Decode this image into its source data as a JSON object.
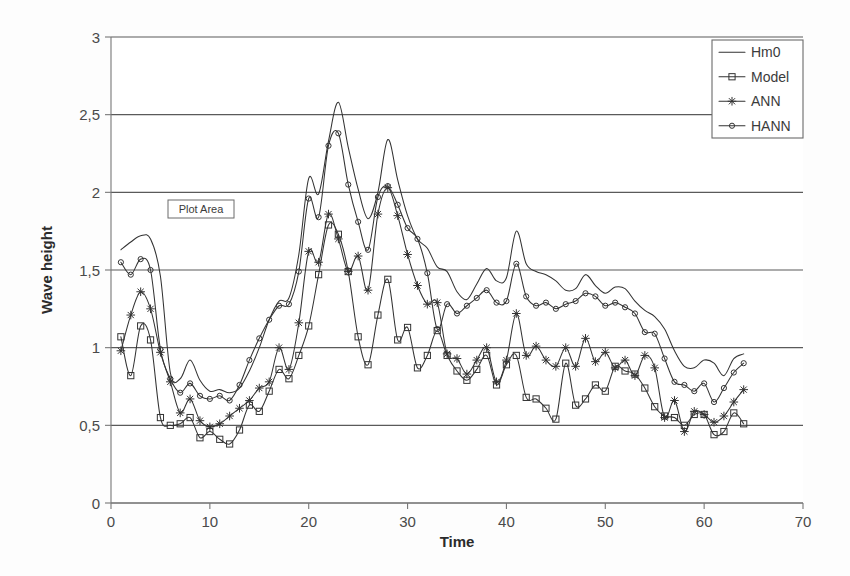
{
  "chart_data": {
    "type": "line",
    "title": "",
    "xlabel": "Time",
    "ylabel": "Wave height",
    "xlim": [
      0,
      70
    ],
    "ylim": [
      0,
      3
    ],
    "xticks": [
      "0",
      "10",
      "20",
      "30",
      "40",
      "50",
      "60",
      "70"
    ],
    "xtick_values": [
      0,
      10,
      20,
      30,
      40,
      50,
      60,
      70
    ],
    "yticks": [
      "0",
      "0,5",
      "1",
      "1,5",
      "2",
      "2,5",
      "3"
    ],
    "ytick_values": [
      0,
      0.5,
      1,
      1.5,
      2,
      2.5,
      3
    ],
    "decimal_separator": ",",
    "grid": "horizontal",
    "legend_position": "top-right",
    "x": [
      1,
      2,
      3,
      4,
      5,
      6,
      7,
      8,
      9,
      10,
      11,
      12,
      13,
      14,
      15,
      16,
      17,
      18,
      19,
      20,
      21,
      22,
      23,
      24,
      25,
      26,
      27,
      28,
      29,
      30,
      31,
      32,
      33,
      34,
      35,
      36,
      37,
      38,
      39,
      40,
      41,
      42,
      43,
      44,
      45,
      46,
      47,
      48,
      49,
      50,
      51,
      52,
      53,
      54,
      55,
      56,
      57,
      58,
      59,
      60,
      61,
      62,
      63,
      64
    ],
    "series": [
      {
        "name": "Hm0",
        "marker": "none",
        "values": [
          1.63,
          1.68,
          1.72,
          1.7,
          1.46,
          0.84,
          0.8,
          0.92,
          0.79,
          0.72,
          0.73,
          0.71,
          0.74,
          0.85,
          1.0,
          1.18,
          1.3,
          1.32,
          1.6,
          2.09,
          1.99,
          2.33,
          2.58,
          2.29,
          2.02,
          1.83,
          2.0,
          2.34,
          2.08,
          1.85,
          1.7,
          1.64,
          1.52,
          1.49,
          1.36,
          1.31,
          1.41,
          1.51,
          1.43,
          1.45,
          1.75,
          1.54,
          1.49,
          1.47,
          1.43,
          1.37,
          1.38,
          1.47,
          1.4,
          1.35,
          1.39,
          1.38,
          1.3,
          1.24,
          1.2,
          1.12,
          0.98,
          0.88,
          0.87,
          0.92,
          0.9,
          0.82,
          0.93,
          0.96
        ],
        "final_value_note": "ends x=64"
      },
      {
        "name": "Model",
        "marker": "square",
        "values": [
          1.07,
          0.82,
          1.14,
          1.05,
          0.55,
          0.5,
          0.51,
          0.55,
          0.42,
          0.46,
          0.41,
          0.38,
          0.47,
          0.63,
          0.59,
          0.72,
          0.86,
          0.8,
          0.95,
          1.14,
          1.47,
          1.79,
          1.73,
          1.49,
          1.07,
          0.89,
          1.21,
          1.44,
          1.05,
          1.13,
          0.87,
          0.95,
          1.11,
          0.95,
          0.85,
          0.79,
          0.86,
          0.95,
          0.76,
          0.89,
          0.95,
          0.68,
          0.67,
          0.61,
          0.54,
          0.9,
          0.63,
          0.67,
          0.76,
          0.72,
          0.88,
          0.85,
          0.83,
          0.74,
          0.62,
          0.56,
          0.55,
          0.5,
          0.57,
          0.57,
          0.44,
          0.46,
          0.58,
          0.51
        ]
      },
      {
        "name": "ANN",
        "marker": "asterisk",
        "values": [
          0.98,
          1.21,
          1.36,
          1.25,
          0.97,
          0.78,
          0.58,
          0.67,
          0.53,
          0.49,
          0.51,
          0.56,
          0.61,
          0.66,
          0.74,
          0.78,
          1.0,
          0.86,
          1.16,
          1.62,
          1.55,
          1.86,
          1.7,
          1.49,
          1.59,
          1.37,
          1.86,
          2.03,
          1.85,
          1.6,
          1.4,
          1.28,
          1.29,
          0.96,
          0.93,
          0.83,
          0.92,
          1.0,
          0.78,
          0.92,
          1.22,
          0.95,
          1.01,
          0.92,
          0.88,
          1.0,
          0.88,
          1.06,
          0.91,
          0.97,
          0.87,
          0.92,
          0.82,
          0.95,
          0.87,
          0.55,
          0.66,
          0.46,
          0.59,
          0.57,
          0.52,
          0.56,
          0.65,
          0.73
        ]
      },
      {
        "name": "HANN",
        "marker": "diamond",
        "values": [
          1.55,
          1.47,
          1.57,
          1.5,
          0.99,
          0.8,
          0.71,
          0.77,
          0.69,
          0.67,
          0.69,
          0.66,
          0.76,
          0.92,
          1.06,
          1.18,
          1.27,
          1.28,
          1.49,
          1.96,
          1.84,
          2.3,
          2.38,
          2.05,
          1.81,
          1.63,
          1.97,
          2.04,
          1.92,
          1.77,
          1.7,
          1.48,
          1.12,
          1.28,
          1.22,
          1.27,
          1.32,
          1.37,
          1.29,
          1.3,
          1.54,
          1.33,
          1.27,
          1.29,
          1.25,
          1.28,
          1.3,
          1.35,
          1.33,
          1.27,
          1.29,
          1.26,
          1.22,
          1.1,
          1.09,
          0.93,
          0.78,
          0.76,
          0.72,
          0.77,
          0.65,
          0.74,
          0.84,
          0.9
        ]
      }
    ],
    "legend": [
      "Hm0",
      "Model",
      "ANN",
      "HANN"
    ],
    "colors": {
      "series_stroke": "#333333",
      "grid": "#5a5a5a",
      "axis": "#777777",
      "text": "#3a3a3a",
      "background": "#ffffff"
    }
  },
  "annotations": {
    "plot_area_tooltip": "Plot Area"
  },
  "axis": {
    "x_title": "Time",
    "y_title": "Wave height"
  }
}
